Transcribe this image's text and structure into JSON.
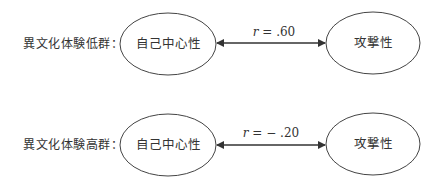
{
  "diagram": {
    "rows": [
      {
        "group_label": "異文化体験低群：",
        "left_node": "自己中心性",
        "right_node": "攻撃性",
        "corr_symbol": "r",
        "corr_value": " = .60"
      },
      {
        "group_label": "異文化体験高群：",
        "left_node": "自己中心性",
        "right_node": "攻撃性",
        "corr_symbol": "r",
        "corr_value": " = − .20"
      }
    ],
    "colors": {
      "stroke": "#333333",
      "text": "#333333",
      "background": "#ffffff"
    }
  }
}
